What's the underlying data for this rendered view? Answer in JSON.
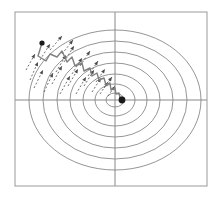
{
  "figure": {
    "title": "",
    "width": 221,
    "height": 199,
    "background_color": "#ffffff"
  },
  "frame": {
    "name": "plot-frame",
    "x": 15,
    "y": 12,
    "width": 192,
    "height": 174,
    "stroke_color": "#999999",
    "stroke_width": 1
  },
  "axes": {
    "x_axis": {
      "label": "",
      "y_position": 100,
      "x_start": 15,
      "x_end": 207,
      "stroke_color": "#888888"
    },
    "y_axis": {
      "label": "",
      "x_position": 115,
      "y_start": 12,
      "y_end": 186,
      "stroke_color": "#888888"
    }
  },
  "chart_data": {
    "type": "line",
    "title": "",
    "subtitle": "",
    "xlabel": "",
    "ylabel": "",
    "xlim": [
      -1.0,
      1.0
    ],
    "ylim": [
      -1.0,
      1.0
    ],
    "grid": false,
    "legend": "none",
    "contours": {
      "name": "elliptical-level-sets",
      "center_x": 115,
      "center_y": 100,
      "stroke_color": "#7a7a7a",
      "stroke_width": 0.8,
      "count": 7,
      "levels": [
        {
          "rx": 9,
          "ry": 7
        },
        {
          "rx": 20,
          "ry": 16
        },
        {
          "rx": 32,
          "ry": 26
        },
        {
          "rx": 45,
          "ry": 37
        },
        {
          "rx": 58,
          "ry": 48
        },
        {
          "rx": 72,
          "ry": 59
        },
        {
          "rx": 86,
          "ry": 70
        }
      ]
    },
    "trajectory": {
      "name": "descent-path",
      "stroke_color": "#808080",
      "stroke_width": 1.4,
      "start_point": [
        42,
        43
      ],
      "end_point": [
        121,
        101
      ],
      "points": [
        [
          42,
          43
        ],
        [
          38,
          56
        ],
        [
          46,
          61
        ],
        [
          50,
          54
        ],
        [
          57,
          57
        ],
        [
          62,
          51
        ],
        [
          67,
          62
        ],
        [
          72,
          57
        ],
        [
          75,
          66
        ],
        [
          82,
          63
        ],
        [
          84,
          71
        ],
        [
          90,
          68
        ],
        [
          92,
          76
        ],
        [
          97,
          73
        ],
        [
          99,
          80
        ],
        [
          104,
          78
        ],
        [
          106,
          85
        ],
        [
          110,
          83
        ],
        [
          111,
          90
        ],
        [
          115,
          88
        ],
        [
          116,
          94
        ],
        [
          119,
          93
        ],
        [
          120,
          98
        ],
        [
          122,
          97
        ],
        [
          121,
          101
        ],
        [
          123,
          100
        ]
      ]
    },
    "gradient_arrows": {
      "name": "gradient-vectors",
      "stroke_color": "#4d4d4d",
      "stroke_width": 0.8,
      "dash_pattern": "2,2",
      "count": 22,
      "vectors": [
        {
          "x1": 30,
          "y1": 80,
          "x2": 38,
          "y2": 62
        },
        {
          "x1": 26,
          "y1": 70,
          "x2": 35,
          "y2": 54
        },
        {
          "x1": 34,
          "y1": 88,
          "x2": 43,
          "y2": 70
        },
        {
          "x1": 44,
          "y1": 92,
          "x2": 53,
          "y2": 73
        },
        {
          "x1": 40,
          "y1": 60,
          "x2": 50,
          "y2": 44
        },
        {
          "x1": 52,
          "y1": 84,
          "x2": 62,
          "y2": 66
        },
        {
          "x1": 56,
          "y1": 72,
          "x2": 66,
          "y2": 55
        },
        {
          "x1": 60,
          "y1": 94,
          "x2": 70,
          "y2": 76
        },
        {
          "x1": 50,
          "y1": 50,
          "x2": 62,
          "y2": 36
        },
        {
          "x1": 64,
          "y1": 62,
          "x2": 74,
          "y2": 46
        },
        {
          "x1": 68,
          "y1": 86,
          "x2": 78,
          "y2": 69
        },
        {
          "x1": 72,
          "y1": 74,
          "x2": 82,
          "y2": 58
        },
        {
          "x1": 76,
          "y1": 94,
          "x2": 86,
          "y2": 77
        },
        {
          "x1": 62,
          "y1": 54,
          "x2": 73,
          "y2": 40
        },
        {
          "x1": 80,
          "y1": 66,
          "x2": 90,
          "y2": 51
        },
        {
          "x1": 84,
          "y1": 86,
          "x2": 94,
          "y2": 70
        },
        {
          "x1": 88,
          "y1": 76,
          "x2": 98,
          "y2": 61
        },
        {
          "x1": 92,
          "y1": 92,
          "x2": 101,
          "y2": 78
        },
        {
          "x1": 96,
          "y1": 82,
          "x2": 105,
          "y2": 69
        },
        {
          "x1": 100,
          "y1": 94,
          "x2": 108,
          "y2": 82
        },
        {
          "x1": 104,
          "y1": 88,
          "x2": 112,
          "y2": 77
        },
        {
          "x1": 108,
          "y1": 96,
          "x2": 115,
          "y2": 86
        }
      ]
    },
    "markers": [
      {
        "name": "start-marker",
        "x": 42,
        "y": 43,
        "r": 2.6,
        "color": "#1a1a1a"
      },
      {
        "name": "minimum-marker",
        "x": 122,
        "y": 100,
        "r": 3.4,
        "color": "#1a1a1a"
      }
    ]
  }
}
